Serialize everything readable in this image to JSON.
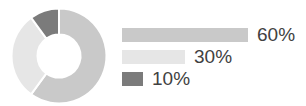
{
  "chart_data": {
    "type": "pie",
    "subtype": "donut",
    "title": "",
    "labels": [
      "60%",
      "30%",
      "10%"
    ],
    "values": [
      60,
      30,
      10
    ],
    "colors": [
      "#c9c9c9",
      "#e6e6e6",
      "#7b7b7b"
    ],
    "start_angle_deg": 0,
    "direction": "clockwise",
    "segment_gap_color": "#ffffff",
    "legend": {
      "position": "right",
      "style": "proportional-bars",
      "items": [
        {
          "label": "60%",
          "value": 60,
          "color": "#c9c9c9"
        },
        {
          "label": "30%",
          "value": 30,
          "color": "#e6e6e6"
        },
        {
          "label": "10%",
          "value": 10,
          "color": "#7b7b7b"
        }
      ]
    },
    "text_color": "#414141",
    "background_color": "#ffffff"
  }
}
